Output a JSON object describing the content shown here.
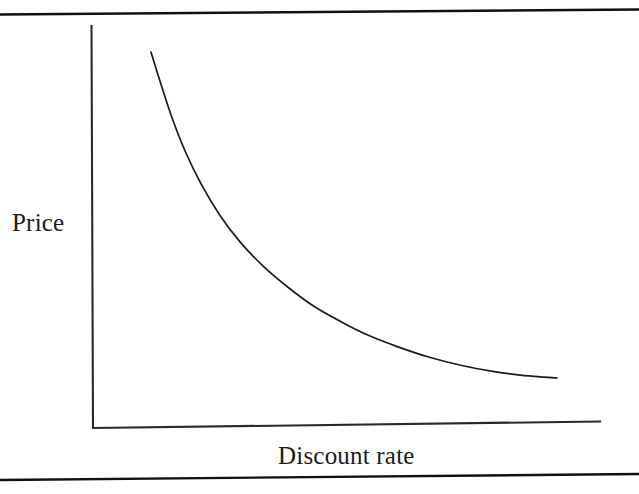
{
  "figure": {
    "kind": "scanned-textbook-figure",
    "background_color": "#ffffff",
    "ink_color": "#1b1b1b",
    "width": 639,
    "height": 494,
    "rules": {
      "top_rule_label": "top-horizontal-rule",
      "bottom_rule_label": "bottom-horizontal-rule"
    }
  },
  "chart_data": {
    "type": "line",
    "title": "",
    "subtitle": "",
    "xlabel": "Discount rate",
    "ylabel": "Price",
    "x_tick_labels": [],
    "y_tick_labels": [],
    "grid": false,
    "legend": null,
    "legend_position": "none",
    "annotations": [],
    "axis_style": {
      "spines": [
        "left",
        "bottom"
      ],
      "arrowheads": false,
      "tick_marks": false,
      "line_color": "#1b1b1b"
    },
    "xlim": [
      0,
      1
    ],
    "ylim": [
      0,
      1
    ],
    "series": [
      {
        "name": "Price",
        "color": "#1b1b1b",
        "x": [
          0.115,
          0.135,
          0.16,
          0.19,
          0.225,
          0.265,
          0.31,
          0.36,
          0.415,
          0.47,
          0.53,
          0.59,
          0.655,
          0.72,
          0.79,
          0.86,
          0.92,
          0.97,
          1.0
        ],
        "y": [
          0.932,
          0.86,
          0.775,
          0.69,
          0.61,
          0.536,
          0.47,
          0.412,
          0.36,
          0.315,
          0.277,
          0.244,
          0.216,
          0.192,
          0.172,
          0.157,
          0.148,
          0.143,
          0.141
        ]
      }
    ]
  },
  "labels": {
    "y_axis": "Price",
    "x_axis": "Discount rate"
  }
}
